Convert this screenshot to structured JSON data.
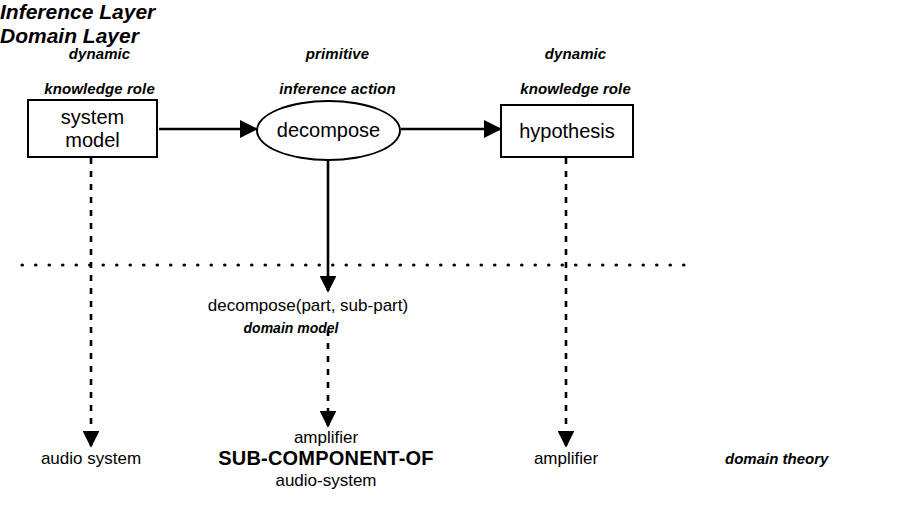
{
  "diagram": {
    "headers": [
      {
        "id": "header-left",
        "line1": "dynamic",
        "line2": "knowledge role"
      },
      {
        "id": "header-center",
        "line1": "primitive",
        "line2": "inference action"
      },
      {
        "id": "header-right",
        "line1": "dynamic",
        "line2": "knowledge role"
      }
    ],
    "nodes": [
      {
        "id": "system-model",
        "shape": "rectangle",
        "line1": "system",
        "line2": "model"
      },
      {
        "id": "decompose",
        "shape": "ellipse",
        "line1": "decompose",
        "line2": ""
      },
      {
        "id": "hypothesis",
        "shape": "rectangle",
        "line1": "hypothesis",
        "line2": ""
      }
    ],
    "layers": {
      "inference": "Inference Layer",
      "domain": "Domain Layer"
    },
    "domain_model": {
      "relation": "decompose(part, sub-part)",
      "caption": "domain model"
    },
    "instances": {
      "left": "audio system",
      "center_line1": "amplifier",
      "center_line2": "SUB-COMPONENT-OF",
      "center_line3": "audio-system",
      "right": "amplifier",
      "theory_caption": "domain theory"
    },
    "colors": {
      "stroke": "#000000",
      "background": "#ffffff"
    }
  }
}
